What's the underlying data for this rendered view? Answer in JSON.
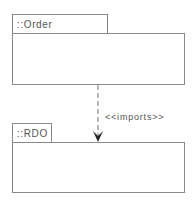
{
  "packages": [
    {
      "name": "::Order Processing"
    },
    {
      "name": "::RDO"
    }
  ],
  "dependency": {
    "label": "<<imports>>",
    "from": "::Order Processing",
    "to": "::RDO",
    "style": "dashed"
  }
}
